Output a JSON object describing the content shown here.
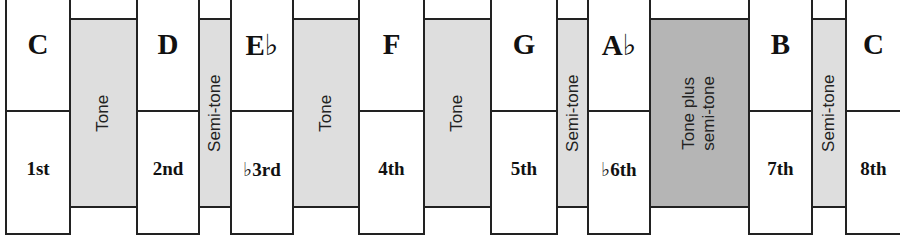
{
  "colors": {
    "tone": "#dedede",
    "semitone": "#dedede",
    "tone_plus_semitone": "#b5b5b5",
    "line": "#222222"
  },
  "notes": [
    {
      "name": "C",
      "degree": "1st",
      "x": 5,
      "w": 66
    },
    {
      "name": "D",
      "degree": "2nd",
      "x": 136,
      "w": 64
    },
    {
      "name": "E♭",
      "degree": "♭3rd",
      "x": 230,
      "w": 64
    },
    {
      "name": "F",
      "degree": "4th",
      "x": 358,
      "w": 67
    },
    {
      "name": "G",
      "degree": "5th",
      "x": 490,
      "w": 68
    },
    {
      "name": "A♭",
      "degree": "♭6th",
      "x": 587,
      "w": 64
    },
    {
      "name": "B",
      "degree": "7th",
      "x": 748,
      "w": 65
    },
    {
      "name": "C",
      "degree": "8th",
      "x": 845,
      "w": 55
    }
  ],
  "intervals": [
    {
      "label": "Tone",
      "x": 70,
      "w": 67,
      "shade": "light"
    },
    {
      "label": "Semi-tone",
      "x": 199,
      "w": 32,
      "shade": "light"
    },
    {
      "label": "Tone",
      "x": 293,
      "w": 66,
      "shade": "light"
    },
    {
      "label": "Tone",
      "x": 424,
      "w": 67,
      "shade": "light"
    },
    {
      "label": "Semi-tone",
      "x": 557,
      "w": 31,
      "shade": "light"
    },
    {
      "label": "Tone plus semi-tone",
      "label_line1": "Tone plus",
      "label_line2": "semi-tone",
      "x": 650,
      "w": 99,
      "shade": "dark"
    },
    {
      "label": "Semi-tone",
      "x": 812,
      "w": 34,
      "shade": "light"
    }
  ]
}
